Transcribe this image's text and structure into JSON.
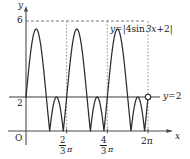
{
  "figure": {
    "kind": "cartesian-graph",
    "background_color": "#ffffff",
    "ink_color": "#1a1a1a"
  },
  "axes": {
    "x_axis_label": "x",
    "y_axis_label": "y",
    "origin_label": "O",
    "x_arrow": true,
    "y_arrow": true
  },
  "labels": {
    "curve_equation": "y = |4 sin 3x + 2|",
    "curve_equation_parts": {
      "lhs": "y",
      "equals": "=",
      "bar_open": "|",
      "coef": "4",
      "func": "sin",
      "arg": "3x",
      "plus": "+",
      "const": "2",
      "bar_close": "|"
    },
    "line_equation": "y = 2",
    "line_equation_parts": {
      "lhs": "y",
      "equals": "=",
      "rhs": "2"
    }
  },
  "y_ticks": [
    {
      "value": 6,
      "label": "6"
    },
    {
      "value": 2,
      "label": "2"
    }
  ],
  "x_ticks": [
    {
      "value": 2.0944,
      "label": "2/3 π",
      "numerator": "2",
      "denominator": "3",
      "symbol": "π"
    },
    {
      "value": 4.1888,
      "label": "4/3 π",
      "numerator": "4",
      "denominator": "3",
      "symbol": "π"
    },
    {
      "value": 6.2832,
      "label": "2π",
      "plain": "2π"
    }
  ],
  "markers": {
    "open_circle": {
      "x_label": "2π",
      "y_label": "2",
      "filled": false
    },
    "dotted_verticals": [
      "2/3 π",
      "4/3 π",
      "2π"
    ],
    "dashed_horizontal": "y = 6"
  },
  "chart_data": {
    "type": "line",
    "title": "",
    "xlabel": "x",
    "ylabel": "y",
    "xlim": [
      -0.45,
      7.35
    ],
    "ylim": [
      -0.9,
      6.9
    ],
    "grid": false,
    "legend": "inline-annotation",
    "series": [
      {
        "name": "y = |4 sin 3x + 2|",
        "expression": "abs(4*sin(3*x)+2)",
        "domain": [
          0,
          6.2832
        ],
        "style": "solid",
        "period": 2.0944,
        "maxima": [
          {
            "x": 0.5236,
            "y": 6
          },
          {
            "x": 2.618,
            "y": 6
          },
          {
            "x": 4.7124,
            "y": 6
          }
        ],
        "zeros": [
          {
            "x": 1.2246,
            "y": 0
          },
          {
            "x": 1.5643,
            "y": 0
          },
          {
            "x": 3.319,
            "y": 0
          },
          {
            "x": 3.6587,
            "y": 0
          },
          {
            "x": 5.4134,
            "y": 0
          },
          {
            "x": 5.7531,
            "y": 0
          }
        ],
        "intersections_with_line": [
          {
            "x": 0,
            "y": 2
          },
          {
            "x": 1.0472,
            "y": 2
          },
          {
            "x": 1.7453,
            "y": 2
          },
          {
            "x": 2.0944,
            "y": 2
          },
          {
            "x": 3.1416,
            "y": 2
          },
          {
            "x": 3.8397,
            "y": 2
          },
          {
            "x": 4.1888,
            "y": 2
          },
          {
            "x": 5.236,
            "y": 2
          },
          {
            "x": 5.9341,
            "y": 2
          },
          {
            "x": 6.2832,
            "y": 2
          }
        ]
      },
      {
        "name": "y = 2",
        "expression": "2",
        "domain": [
          -0.45,
          7.1
        ],
        "style": "solid-horizontal",
        "values": [
          2,
          2
        ]
      }
    ]
  }
}
